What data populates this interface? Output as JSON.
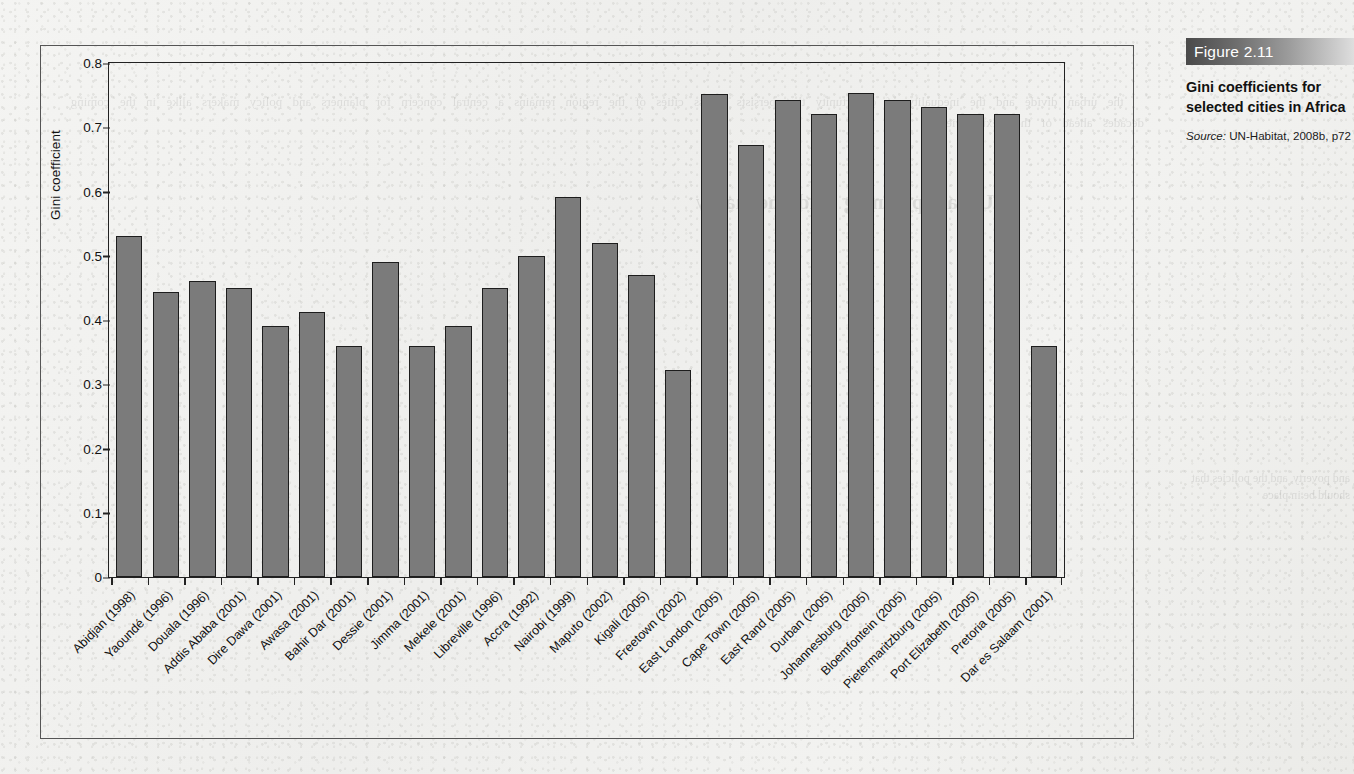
{
  "figure": {
    "badge_label": "Figure 2.11",
    "caption_title": "Gini coefficients for selected cities in Africa",
    "source_label": "Source:",
    "source_text": " UN-Habitat, 2008b, p72"
  },
  "colors": {
    "bar_fill": "#7b7b7b",
    "bar_stroke": "#1d1d1d",
    "axis": "#222222",
    "page_background": "#f0f0ee",
    "badge_gradient_start": "#4a4a4a",
    "badge_gradient_end": "#dedede"
  },
  "chart_data": {
    "type": "bar",
    "title": "Gini coefficients for selected cities in Africa",
    "xlabel": "",
    "ylabel": "Gini coefficient",
    "ylim": [
      0,
      0.8
    ],
    "grid": false,
    "legend": "none",
    "ytick_labels": [
      "0.8",
      "0.7",
      "0.6",
      "0.5",
      "0.4",
      "0.3",
      "0.2",
      "0.1",
      "0"
    ],
    "ytick_values": [
      0.8,
      0.7,
      0.6,
      0.5,
      0.4,
      0.3,
      0.2,
      0.1,
      0
    ],
    "categories": [
      "Abidjan (1998)",
      "Yaoundé (1996)",
      "Douala (1996)",
      "Addis Ababa (2001)",
      "Dire Dawa (2001)",
      "Awasa (2001)",
      "Bahir Dar (2001)",
      "Dessie (2001)",
      "Jimma (2001)",
      "Mekele (2001)",
      "Libreville (1996)",
      "Accra (1992)",
      "Nairobi (1999)",
      "Maputo (2002)",
      "Kigali (2005)",
      "Freetown (2002)",
      "East London (2005)",
      "Cape Town (2005)",
      "East Rand (2005)",
      "Durban (2005)",
      "Johannesburg (2005)",
      "Bloemfontein (2005)",
      "Pietermaritzburg (2005)",
      "Port Elizabeth (2005)",
      "Pretoria (2005)",
      "Dar es Salaam (2001)"
    ],
    "values": [
      0.53,
      0.443,
      0.46,
      0.45,
      0.39,
      0.413,
      0.36,
      0.49,
      0.36,
      0.39,
      0.45,
      0.5,
      0.592,
      0.52,
      0.47,
      0.322,
      0.752,
      0.672,
      0.742,
      0.721,
      0.753,
      0.742,
      0.732,
      0.721,
      0.721,
      0.36
    ]
  },
  "bleed": {
    "left_text": "the urban divide and the inequality of opportunity that persists across cities of the region remains a central concern for planners and policy makers alike in the coming decades ahead of the next review",
    "left_heading": "Urban planning and inequality",
    "right_text": "and poverty, and the policies that should be in place"
  }
}
